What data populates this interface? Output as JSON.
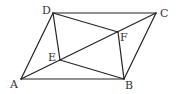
{
  "diagram": {
    "type": "geometry",
    "stroke_color": "#222222",
    "points": {
      "A": {
        "x": 21,
        "y": 79,
        "label": "A",
        "lx": 10,
        "ly": 88
      },
      "B": {
        "x": 124,
        "y": 79,
        "label": "B",
        "lx": 125,
        "ly": 89
      },
      "C": {
        "x": 156,
        "y": 13,
        "label": "C",
        "lx": 160,
        "ly": 17
      },
      "D": {
        "x": 53,
        "y": 13,
        "label": "D",
        "lx": 42,
        "ly": 14
      },
      "E": {
        "x": 60,
        "y": 60,
        "label": "E",
        "lx": 48,
        "ly": 61
      },
      "F": {
        "x": 118,
        "y": 32,
        "label": "F",
        "lx": 120,
        "ly": 41
      }
    },
    "segments": [
      [
        "A",
        "B"
      ],
      [
        "B",
        "C"
      ],
      [
        "C",
        "D"
      ],
      [
        "D",
        "A"
      ],
      [
        "A",
        "C"
      ],
      [
        "D",
        "E"
      ],
      [
        "D",
        "F"
      ],
      [
        "B",
        "E"
      ],
      [
        "B",
        "F"
      ]
    ]
  }
}
